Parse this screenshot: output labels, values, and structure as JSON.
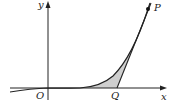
{
  "diagram": {
    "labels": {
      "y_axis": "y",
      "x_axis": "x",
      "origin": "O",
      "point_q": "Q",
      "point_p": "P"
    },
    "colors": {
      "stroke": "#222222",
      "shade": "#cfcfcf"
    }
  }
}
